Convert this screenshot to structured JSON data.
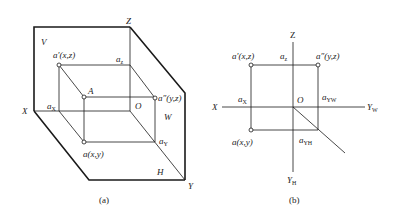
{
  "figure_a": {
    "caption": "(a)",
    "planes": {
      "V": "V",
      "W": "W",
      "H": "H"
    },
    "axes": {
      "X": "X",
      "Y": "Y",
      "Z": "Z",
      "O": "O"
    },
    "points": {
      "a_prime": "a′(x,z)",
      "a_double_prime": "a″(y,z)",
      "A": "A",
      "a": "a(x,y)",
      "a_x": "a",
      "a_x_sub": "X",
      "a_z": "a",
      "a_z_sub": "z",
      "a_y": "a",
      "a_y_sub": "Y"
    }
  },
  "figure_b": {
    "caption": "(b)",
    "axes": {
      "X": "X",
      "Z": "Z",
      "O": "O",
      "Y_W": "Y",
      "Y_W_sub": "W",
      "Y_H": "Y",
      "Y_H_sub": "H"
    },
    "points": {
      "a_prime": "a′(x,z)",
      "a_double_prime": "a″(y,z)",
      "a": "a(x,y)",
      "a_x": "a",
      "a_x_sub": "X",
      "a_z": "a",
      "a_z_sub": "z",
      "a_yw": "a",
      "a_yw_sub": "YW",
      "a_yh": "a",
      "a_yh_sub": "YH"
    }
  }
}
